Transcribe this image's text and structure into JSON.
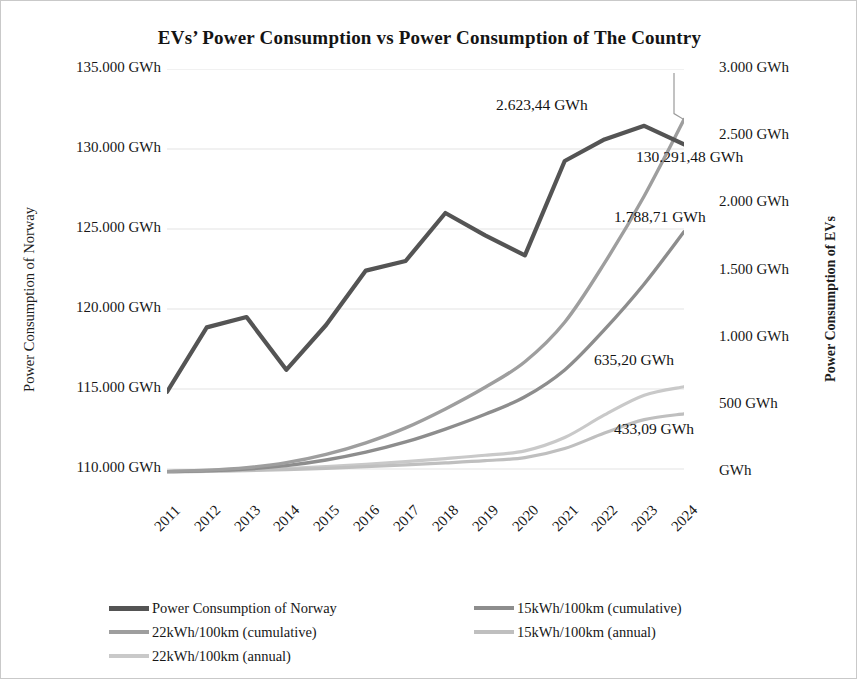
{
  "chart_data": {
    "type": "line",
    "title": "EVs’ Power Consumption  vs Power Consumption  of The Country",
    "xlabel": "",
    "grid": true,
    "legend_position": "bottom",
    "categories": [
      "2011",
      "2012",
      "2013",
      "2014",
      "2015",
      "2016",
      "2017",
      "2018",
      "2019",
      "2020",
      "2021",
      "2022",
      "2023",
      "2024"
    ],
    "axes": {
      "left": {
        "label": "Power Consumption of Norway",
        "ticks": [
          "110.000 GWh",
          "115.000 GWh",
          "120.000 GWh",
          "125.000 GWh",
          "130.000 GWh",
          "135.000 GWh"
        ],
        "tick_values": [
          110000,
          115000,
          120000,
          125000,
          130000,
          135000
        ],
        "ylim": [
          107500,
          135000
        ]
      },
      "right": {
        "label": "Power Consumption of EVs",
        "ticks": [
          "GWh",
          "500 GWh",
          "1.000 GWh",
          "1.500 GWh",
          "2.000 GWh",
          "2.500 GWh",
          "3.000 GWh"
        ],
        "tick_values": [
          0,
          500,
          1000,
          1500,
          2000,
          2500,
          3000
        ],
        "ylim": [
          -275,
          3000
        ]
      }
    },
    "series": [
      {
        "name": "Power Consumption of Norway",
        "axis": "left",
        "color": "#545454",
        "width": 4.2,
        "values": [
          114820,
          118850,
          119500,
          116200,
          119000,
          122400,
          123000,
          126000,
          124600,
          123350,
          129250,
          130600,
          131450,
          130291
        ]
      },
      {
        "name": "15kWh/100km (cumulative)",
        "axis": "right",
        "color": "#8d8d8d",
        "width": 3.4,
        "values": [
          3,
          9,
          22,
          48,
          90,
          148,
          224,
          320,
          430,
          560,
          760,
          1060,
          1400,
          1788.71
        ]
      },
      {
        "name": "22kWh/100km (cumulative)",
        "axis": "right",
        "color": "#9e9e9e",
        "width": 3.4,
        "values": [
          5,
          14,
          33,
          70,
          132,
          218,
          329,
          470,
          631,
          821,
          1115,
          1555,
          2055,
          2623.44
        ]
      },
      {
        "name": "15kWh/100km (annual)",
        "axis": "right",
        "color": "#bfbfbf",
        "width": 3.2,
        "values": [
          2,
          5,
          10,
          18,
          28,
          40,
          53,
          68,
          85,
          108,
          175,
          290,
          390,
          433.09
        ]
      },
      {
        "name": "22kWh/100km (annual)",
        "axis": "right",
        "color": "#c9c9c9",
        "width": 3.2,
        "values": [
          3,
          7,
          14,
          26,
          41,
          58,
          78,
          100,
          125,
          158,
          257,
          425,
          572,
          635.2
        ]
      }
    ],
    "annotations": [
      {
        "text": "2.623,44 GWh",
        "series": "22kWh/100km (cumulative)",
        "value": 2623.44,
        "x": "2024"
      },
      {
        "text": "130.291,48 GWh",
        "series": "Power Consumption of Norway",
        "value": 130291.48,
        "x": "2024"
      },
      {
        "text": "1.788,71 GWh",
        "series": "15kWh/100km (cumulative)",
        "value": 1788.71,
        "x": "2024"
      },
      {
        "text": "635,20 GWh",
        "series": "22kWh/100km (annual)",
        "value": 635.2,
        "x": "2024"
      },
      {
        "text": "433,09 GWh",
        "series": "15kWh/100km (annual)",
        "value": 433.09,
        "x": "2024"
      }
    ],
    "legend": [
      {
        "label": "Power Consumption of Norway",
        "color": "#545454"
      },
      {
        "label": "15kWh/100km (cumulative)",
        "color": "#8d8d8d"
      },
      {
        "label": "22kWh/100km (cumulative)",
        "color": "#9e9e9e"
      },
      {
        "label": "15kWh/100km (annual)",
        "color": "#bfbfbf"
      },
      {
        "label": "22kWh/100km (annual)",
        "color": "#c9c9c9"
      }
    ]
  }
}
